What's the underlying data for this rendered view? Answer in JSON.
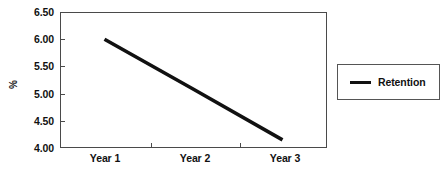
{
  "chart_data": {
    "type": "line",
    "title": "",
    "xlabel": "",
    "ylabel": "%",
    "categories": [
      "Year 1",
      "Year 2",
      "Year 3"
    ],
    "series": [
      {
        "name": "Retention",
        "values": [
          6.0,
          5.08,
          4.15
        ],
        "color": "#111111"
      }
    ],
    "ylim": [
      4.0,
      6.5
    ],
    "ytick_labels": [
      "6.50",
      "6.00",
      "5.50",
      "5.00",
      "4.50",
      "4.00"
    ],
    "ytick_values": [
      6.5,
      6.0,
      5.5,
      5.0,
      4.5,
      4.0
    ],
    "grid": false,
    "legend_position": "right"
  },
  "legend": {
    "entries": [
      {
        "label": "Retention"
      }
    ]
  },
  "axes": {
    "y_title": "%",
    "y_labels": {
      "t0": "6.50",
      "t1": "6.00",
      "t2": "5.50",
      "t3": "5.00",
      "t4": "4.50",
      "t5": "4.00"
    },
    "x_labels": {
      "c0": "Year 1",
      "c1": "Year 2",
      "c2": "Year 3"
    }
  }
}
